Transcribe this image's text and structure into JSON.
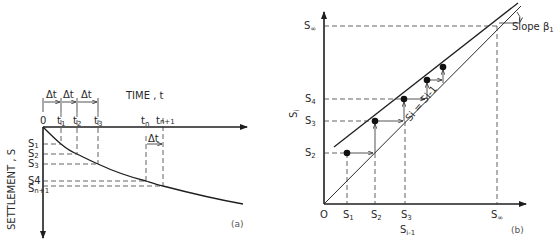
{
  "figure_a": {
    "caption": "(a)",
    "x_axis_label": "TIME , t",
    "y_axis_label": "SETTLEMENT , S",
    "origin_label": "0",
    "delta_t_label": "Δt",
    "time_ticks": [
      {
        "label": "t",
        "sub": "1",
        "x": 61
      },
      {
        "label": "t",
        "sub": "2",
        "x": 77
      },
      {
        "label": "t",
        "sub": "3",
        "x": 98
      },
      {
        "label": "t",
        "sub": "n",
        "x": 146
      },
      {
        "label": "t",
        "sub": "n+1",
        "x": 163
      }
    ],
    "settlement_ticks": [
      {
        "label": "S",
        "sub": "1",
        "y": 144
      },
      {
        "label": "S",
        "sub": "2",
        "y": 154
      },
      {
        "label": "S",
        "sub": "3",
        "y": 164
      },
      {
        "label": "S4",
        "sub": "",
        "y": 182
      },
      {
        "label": "S",
        "sub": "n+1",
        "y": 187
      }
    ]
  },
  "figure_b": {
    "caption": "(b)",
    "x_axis_label": "S",
    "x_axis_sub": "i-1",
    "y_axis_label": "S",
    "y_axis_sub": "i",
    "origin_label": "O",
    "line_label": "S",
    "line_label_text": "Si = Si-1",
    "slope_label": "Slope β",
    "slope_sub": "1",
    "x_ticks": [
      {
        "label": "S",
        "sub": "1",
        "x": 347
      },
      {
        "label": "S",
        "sub": "2",
        "x": 375
      },
      {
        "label": "S",
        "sub": "3",
        "x": 405
      },
      {
        "label": "S",
        "sub": "∞",
        "x": 497
      }
    ],
    "y_ticks": [
      {
        "label": "S",
        "sub": "∞",
        "y": 26
      },
      {
        "label": "S",
        "sub": "4",
        "y": 99
      },
      {
        "label": "S",
        "sub": "3",
        "y": 121
      },
      {
        "label": "S",
        "sub": "2",
        "y": 153
      }
    ],
    "points": [
      {
        "x": 347,
        "y": 153
      },
      {
        "x": 375,
        "y": 121
      },
      {
        "x": 404,
        "y": 99
      },
      {
        "x": 427,
        "y": 80
      },
      {
        "x": 443,
        "y": 67
      }
    ]
  }
}
